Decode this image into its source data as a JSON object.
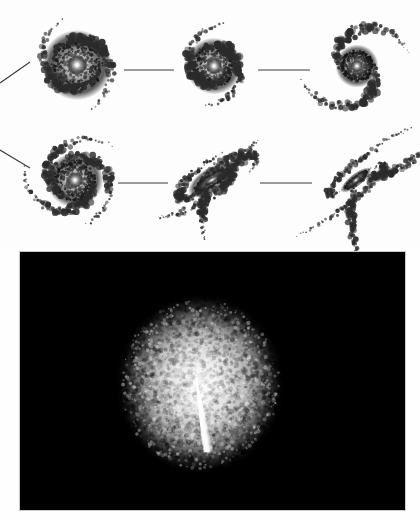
{
  "figure": {
    "kind": "astronomy-figure",
    "background_color": "#ffffff",
    "width": 420,
    "height": 521,
    "caption_text": "",
    "panels": [
      {
        "name": "sequence-panel",
        "role": "galaxy-morphology-sequence",
        "background_color": "#fdfdfd",
        "x": 0,
        "y": 0,
        "width": 420,
        "height": 246
      },
      {
        "name": "image-panel",
        "role": "diffuse-remnant-image",
        "background_color": "#000000",
        "x": 20,
        "y": 252,
        "width": 385,
        "height": 258
      }
    ]
  },
  "sequence": {
    "row_count": 2,
    "column_count": 3,
    "connector_color": "#3a3a3a",
    "arm_color": "#2b2b2b",
    "core_color": "#ffffff",
    "galaxies": [
      {
        "id": "galaxy-1",
        "label": "top-left",
        "row": 1,
        "column": 1,
        "center_x": 77,
        "center_y": 65,
        "radius": 48,
        "core_radius": 26,
        "core_brightness": 1.0,
        "arm_count": 2,
        "arm_winding": "tight",
        "inclination_deg": 0,
        "rotation_deg": 0,
        "morphology": "round-tightly-wound-spiral",
        "disruption": 0.0
      },
      {
        "id": "galaxy-2",
        "label": "top-center",
        "row": 1,
        "column": 2,
        "center_x": 214,
        "center_y": 66,
        "radius": 41,
        "core_radius": 21,
        "core_brightness": 0.92,
        "arm_count": 2,
        "arm_winding": "tight",
        "inclination_deg": 0,
        "rotation_deg": 25,
        "morphology": "round-spiral-open-ring",
        "disruption": 0.1
      },
      {
        "id": "galaxy-3",
        "label": "top-right",
        "row": 1,
        "column": 3,
        "center_x": 357,
        "center_y": 66,
        "radius": 52,
        "core_radius": 16,
        "core_brightness": 0.88,
        "arm_count": 2,
        "arm_winding": "open",
        "inclination_deg": 0,
        "rotation_deg": -15,
        "morphology": "grand-design-open-spiral",
        "disruption": 0.2
      },
      {
        "id": "galaxy-4",
        "label": "bottom-left",
        "row": 2,
        "column": 1,
        "center_x": 75,
        "center_y": 180,
        "radius": 46,
        "core_radius": 21,
        "core_brightness": 0.95,
        "arm_count": 3,
        "arm_winding": "medium",
        "inclination_deg": 15,
        "rotation_deg": -20,
        "morphology": "multi-arm-spiral",
        "disruption": 0.3
      },
      {
        "id": "galaxy-5",
        "label": "bottom-center",
        "row": 2,
        "column": 2,
        "center_x": 212,
        "center_y": 180,
        "radius": 50,
        "core_radius": 20,
        "core_brightness": 0.9,
        "arm_count": 3,
        "arm_winding": "trailing",
        "inclination_deg": 62,
        "rotation_deg": -32,
        "morphology": "inclined-disturbed-disk",
        "disruption": 0.6
      },
      {
        "id": "galaxy-6",
        "label": "bottom-right",
        "row": 2,
        "column": 3,
        "center_x": 356,
        "center_y": 180,
        "radius": 58,
        "core_radius": 14,
        "core_brightness": 0.85,
        "arm_count": 2,
        "arm_winding": "tidal-tails",
        "inclination_deg": 70,
        "rotation_deg": -38,
        "morphology": "merger-with-long-tidal-tails",
        "disruption": 0.95
      }
    ],
    "connectors": [
      {
        "id": "connector-in-row1",
        "type": "diagonal",
        "x1": 0,
        "y1": 83,
        "x2": 30,
        "y2": 62
      },
      {
        "id": "connector-1-2",
        "type": "horizontal",
        "x1": 124,
        "y1": 70,
        "x2": 174,
        "y2": 70
      },
      {
        "id": "connector-2-3",
        "type": "horizontal",
        "x1": 258,
        "y1": 70,
        "x2": 310,
        "y2": 70
      },
      {
        "id": "connector-in-row2",
        "type": "diagonal",
        "x1": 0,
        "y1": 150,
        "x2": 30,
        "y2": 168
      },
      {
        "id": "connector-4-5",
        "type": "horizontal",
        "x1": 118,
        "y1": 183,
        "x2": 168,
        "y2": 183
      },
      {
        "id": "connector-5-6",
        "type": "horizontal",
        "x1": 260,
        "y1": 183,
        "x2": 312,
        "y2": 183
      }
    ]
  },
  "chart_data": {
    "type": "scatter",
    "title": "",
    "xlabel": "",
    "ylabel": "",
    "categories": [
      "top-left",
      "top-center",
      "top-right",
      "bottom-left",
      "bottom-center",
      "bottom-right"
    ],
    "series": [
      {
        "name": "disruption_fraction",
        "values": [
          0.0,
          0.1,
          0.2,
          0.3,
          0.6,
          0.95
        ]
      },
      {
        "name": "core_brightness",
        "values": [
          1.0,
          0.92,
          0.88,
          0.95,
          0.9,
          0.85
        ]
      },
      {
        "name": "arm_count",
        "values": [
          2,
          2,
          2,
          3,
          3,
          2
        ]
      }
    ],
    "grid": false,
    "legend_position": "none"
  },
  "remnant_image": {
    "id": "remnant-blob",
    "center_x": 200,
    "center_y": 384,
    "radius_x": 86,
    "radius_y": 92,
    "peak_brightness": 1.0,
    "background_color": "#000000",
    "glow_color": "#ffffff",
    "noise_level": 0.22,
    "jet": {
      "id": "central-spike",
      "present": true,
      "origin_x": 196,
      "origin_y": 378,
      "tip_x": 208,
      "tip_y": 452,
      "angle_deg": 190,
      "length": 75,
      "brightness": 1.0
    }
  }
}
